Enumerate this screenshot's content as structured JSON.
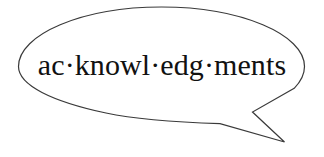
{
  "illustration": {
    "type": "speech-bubble",
    "shape": "ellipse-with-pointed-tail",
    "tail_direction": "bottom-right",
    "headword": "ac·knowl·edg·ments",
    "syllables": [
      "ac",
      "knowl",
      "edg",
      "ments"
    ],
    "separator": "·",
    "colors": {
      "background": "#ffffff",
      "bubble_fill": "#ffffff",
      "bubble_stroke": "#3a3a3a",
      "text": "#111111"
    }
  }
}
